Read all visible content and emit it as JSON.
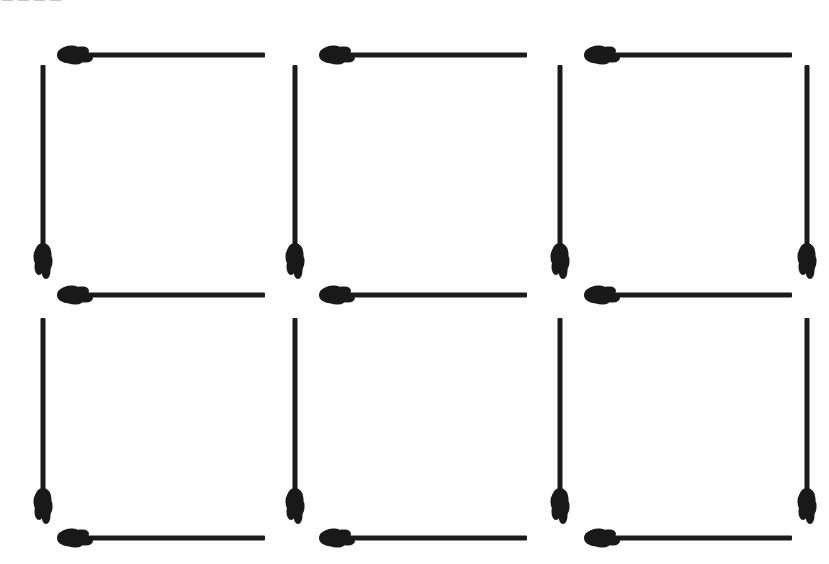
{
  "page": {
    "background_color": "#ffffff",
    "match_color": "#1b1b1b",
    "width": 829,
    "height": 564,
    "top_caption": "— — — —"
  },
  "figure": {
    "columns": 3,
    "rows": 2,
    "total_matches": 20,
    "horizontal_count": 9,
    "vertical_count": 8
  },
  "matches": {
    "horizontal": [
      {
        "name": "h-top-1",
        "x": 60,
        "y": 46,
        "length": 205,
        "head": "left"
      },
      {
        "name": "h-top-2",
        "x": 322,
        "y": 46,
        "length": 205,
        "head": "left"
      },
      {
        "name": "h-top-3",
        "x": 587,
        "y": 46,
        "length": 205,
        "head": "left"
      },
      {
        "name": "h-mid-1",
        "x": 60,
        "y": 286,
        "length": 205,
        "head": "left"
      },
      {
        "name": "h-mid-2",
        "x": 322,
        "y": 286,
        "length": 205,
        "head": "left"
      },
      {
        "name": "h-mid-3",
        "x": 587,
        "y": 286,
        "length": 205,
        "head": "left"
      },
      {
        "name": "h-bottom-1",
        "x": 60,
        "y": 529,
        "length": 205,
        "head": "left"
      },
      {
        "name": "h-bottom-2",
        "x": 322,
        "y": 529,
        "length": 205,
        "head": "left"
      },
      {
        "name": "h-bottom-3",
        "x": 587,
        "y": 529,
        "length": 205,
        "head": "left"
      }
    ],
    "vertical": [
      {
        "name": "v-upper-1",
        "x": 34,
        "y": 65,
        "length": 198,
        "head": "bottom"
      },
      {
        "name": "v-upper-2",
        "x": 286,
        "y": 65,
        "length": 198,
        "head": "bottom"
      },
      {
        "name": "v-upper-3",
        "x": 551,
        "y": 65,
        "length": 198,
        "head": "bottom"
      },
      {
        "name": "v-upper-4",
        "x": 798,
        "y": 65,
        "length": 198,
        "head": "bottom"
      },
      {
        "name": "v-lower-1",
        "x": 34,
        "y": 318,
        "length": 190,
        "head": "bottom"
      },
      {
        "name": "v-lower-2",
        "x": 286,
        "y": 318,
        "length": 190,
        "head": "bottom"
      },
      {
        "name": "v-lower-3",
        "x": 551,
        "y": 318,
        "length": 190,
        "head": "bottom"
      },
      {
        "name": "v-lower-4",
        "x": 798,
        "y": 318,
        "length": 190,
        "head": "bottom"
      }
    ]
  }
}
